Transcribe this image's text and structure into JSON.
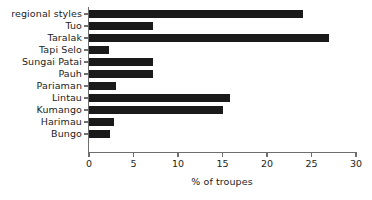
{
  "chart_data": {
    "type": "bar",
    "orientation": "horizontal",
    "title": "",
    "xlabel": "% of troupes",
    "ylabel": "",
    "xlim": [
      0,
      30
    ],
    "xticks": [
      0,
      5,
      10,
      15,
      20,
      25,
      30
    ],
    "xtick_labels": [
      "0",
      "5",
      "10",
      "15",
      "20",
      "25",
      "30"
    ],
    "grid": false,
    "legend": null,
    "bar_color": "#1a1a1a",
    "axis_color": "#6e6e6e",
    "categories": [
      "regional styles",
      "Tuo",
      "Taralak",
      "Tapi Selo",
      "Sungai Patai",
      "Pauh",
      "Pariaman",
      "Lintau",
      "Kumango",
      "Harimau",
      "Bungo"
    ],
    "values": [
      24,
      7.2,
      27,
      2.2,
      7.2,
      7.2,
      3,
      15.8,
      15.1,
      2.8,
      2.4
    ],
    "series": [
      {
        "name": "% of troupes",
        "values": [
          24,
          7.2,
          27,
          2.2,
          7.2,
          7.2,
          3,
          15.8,
          15.1,
          2.8,
          2.4
        ]
      }
    ]
  }
}
